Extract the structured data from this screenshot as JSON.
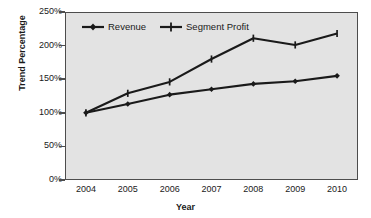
{
  "chart_data": {
    "type": "line",
    "title": "",
    "xlabel": "Year",
    "ylabel": "Trend Percentage",
    "categories": [
      "2004",
      "2005",
      "2006",
      "2007",
      "2008",
      "2009",
      "2010"
    ],
    "ylim": [
      0,
      250
    ],
    "ytick_labels": [
      "0%",
      "50%",
      "100%",
      "150%",
      "200%",
      "250%"
    ],
    "ytick_values": [
      0,
      50,
      100,
      150,
      200,
      250
    ],
    "grid": false,
    "legend_position": "top-inside-left",
    "series": [
      {
        "name": "Revenue",
        "marker": "diamond",
        "color": "#1a1a1a",
        "values": [
          100,
          113,
          127,
          135,
          143,
          147,
          155
        ]
      },
      {
        "name": "Segment Profit",
        "marker": "plus",
        "color": "#1a1a1a",
        "values": [
          100,
          129,
          146,
          180,
          211,
          201,
          218
        ]
      }
    ]
  },
  "colors": {
    "plot_background": "#e3e3e3",
    "page_background": "#ffffff",
    "axis": "#4d4d4d",
    "text": "#1a1a1a"
  }
}
